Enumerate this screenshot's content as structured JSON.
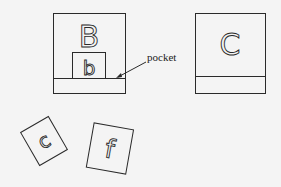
{
  "diagram": {
    "type": "illustration",
    "elements": {
      "envelope_left": {
        "letter": "B",
        "inner_card_letter": "b"
      },
      "envelope_right": {
        "letter": "C"
      },
      "loose_cards": [
        {
          "letter": "c"
        },
        {
          "letter": "f"
        }
      ],
      "annotation": {
        "label": "pocket"
      }
    }
  }
}
